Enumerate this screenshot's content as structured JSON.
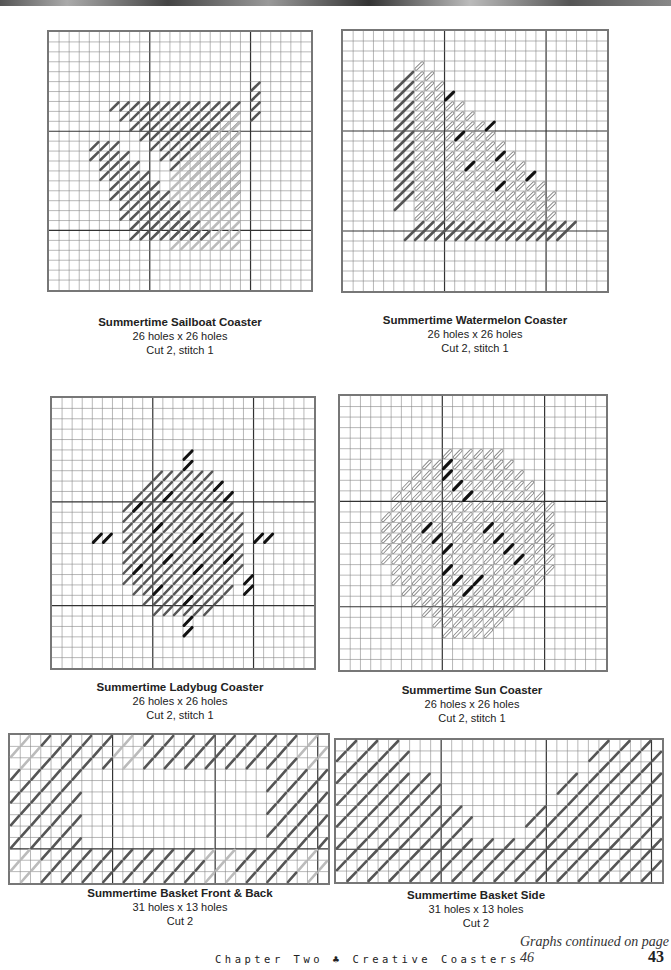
{
  "page": {
    "continued_note": "Graphs continued on page 46",
    "footer_text": "Chapter Two ♣ Creative Coasters",
    "page_number": "43"
  },
  "graphs": [
    {
      "title": "Summertime Sailboat Coaster",
      "size": "26 holes x 26 holes",
      "cut": "Cut 2, stitch 1"
    },
    {
      "title": "Summertime Watermelon Coaster",
      "size": "26 holes x 26 holes",
      "cut": "Cut 2, stitch 1"
    },
    {
      "title": "Summertime Ladybug Coaster",
      "size": "26 holes x 26 holes",
      "cut": "Cut 2, stitch 1"
    },
    {
      "title": "Summertime Sun Coaster",
      "size": "26 holes x 26 holes",
      "cut": "Cut 2, stitch 1"
    },
    {
      "title": "Summertime Basket Front & Back",
      "size": "31 holes x 13 holes",
      "cut": "Cut 2",
      "word": "SUMMER"
    },
    {
      "title": "Summertime Basket Side",
      "size": "31 holes x 13 holes",
      "cut": "Cut 2"
    }
  ],
  "colors": {
    "dark_stitch": "#555555",
    "light_stitch": "#bbbbbb",
    "black_stitch": "#111111",
    "grid": "#888888",
    "grid_major": "#333333"
  }
}
